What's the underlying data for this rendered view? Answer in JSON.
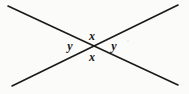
{
  "figure": {
    "name": "vertical-angles-diagram",
    "background_color": "#fbfbf9",
    "stroke_color": "#1a1a1a",
    "stroke_width": 1.6,
    "width": 189,
    "height": 94,
    "intersection": {
      "x": 93,
      "y": 46
    },
    "lines": [
      {
        "name": "line-upper-left-to-lower-right",
        "x1": 8,
        "y1": 6,
        "x2": 178,
        "y2": 85
      },
      {
        "name": "line-lower-left-to-upper-right",
        "x1": 12,
        "y1": 86,
        "x2": 178,
        "y2": 5
      }
    ],
    "labels": [
      {
        "name": "angle-label-x-top",
        "text": "x",
        "x": 92,
        "y": 36
      },
      {
        "name": "angle-label-y-left",
        "text": "y",
        "x": 70,
        "y": 46
      },
      {
        "name": "angle-label-y-right",
        "text": "y",
        "x": 114,
        "y": 46
      },
      {
        "name": "angle-label-x-bottom",
        "text": "x",
        "x": 92,
        "y": 57
      }
    ]
  }
}
